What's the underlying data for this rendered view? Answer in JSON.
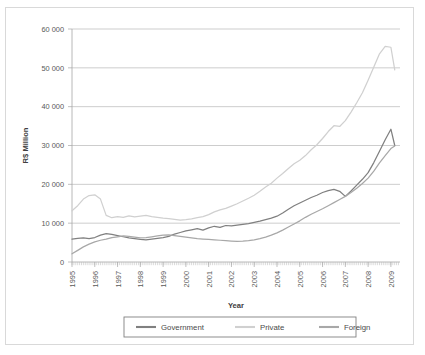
{
  "chart_data": {
    "type": "line",
    "title": "",
    "xlabel": "Year",
    "ylabel": "R$ Million",
    "xlim": [
      1995,
      2009.4
    ],
    "ylim": [
      0,
      60000
    ],
    "yticks": [
      0,
      10000,
      20000,
      30000,
      40000,
      50000,
      60000
    ],
    "ytick_labels": [
      "0",
      "10 000",
      "20 000",
      "30 000",
      "40 000",
      "50 000",
      "60 000"
    ],
    "xticks": [
      1995,
      1996,
      1997,
      1998,
      1999,
      2000,
      2001,
      2002,
      2003,
      2004,
      2005,
      2006,
      2007,
      2008,
      2009
    ],
    "xtick_labels": [
      "1995",
      "1996",
      "1997",
      "1998",
      "1999",
      "2000",
      "2001",
      "2002",
      "2003",
      "2004",
      "2005",
      "2006",
      "2007",
      "2008",
      "2009"
    ],
    "grid": "horizontal",
    "legend_position": "bottom",
    "legend": [
      "Government",
      "Private",
      "Foreign"
    ],
    "colors": {
      "government": "#808080",
      "private": "#d0d0d0",
      "foreign": "#a8a8a8"
    },
    "x": [
      1995.0,
      1995.25,
      1995.5,
      1995.75,
      1996.0,
      1996.25,
      1996.5,
      1996.75,
      1997.0,
      1997.25,
      1997.5,
      1997.75,
      1998.0,
      1998.25,
      1998.5,
      1998.75,
      1999.0,
      1999.25,
      1999.5,
      1999.75,
      2000.0,
      2000.25,
      2000.5,
      2000.75,
      2001.0,
      2001.25,
      2001.5,
      2001.75,
      2002.0,
      2002.25,
      2002.5,
      2002.75,
      2003.0,
      2003.25,
      2003.5,
      2003.75,
      2004.0,
      2004.25,
      2004.5,
      2004.75,
      2005.0,
      2005.25,
      2005.5,
      2005.75,
      2006.0,
      2006.25,
      2006.5,
      2006.75,
      2007.0,
      2007.25,
      2007.5,
      2007.75,
      2008.0,
      2008.25,
      2008.5,
      2008.75,
      2009.0,
      2009.17
    ],
    "series": [
      {
        "name": "Government",
        "color": "#808080",
        "values": [
          5900,
          6100,
          6200,
          6050,
          6300,
          6900,
          7300,
          7100,
          6800,
          6500,
          6200,
          6000,
          5800,
          5700,
          5900,
          6100,
          6300,
          6600,
          7200,
          7600,
          8000,
          8300,
          8600,
          8200,
          8800,
          9200,
          8900,
          9400,
          9300,
          9500,
          9700,
          9900,
          10200,
          10500,
          10900,
          11300,
          11800,
          12600,
          13600,
          14500,
          15200,
          15900,
          16600,
          17200,
          17900,
          18400,
          18700,
          18200,
          16900,
          18300,
          19800,
          21300,
          23000,
          25600,
          28500,
          31500,
          34200,
          30000
        ]
      },
      {
        "name": "Private",
        "color": "#d0d0d0",
        "values": [
          13200,
          14500,
          16200,
          17100,
          17300,
          16200,
          12000,
          11400,
          11700,
          11500,
          11900,
          11600,
          11800,
          12000,
          11700,
          11500,
          11300,
          11200,
          11000,
          10800,
          10900,
          11100,
          11400,
          11700,
          12200,
          12900,
          13400,
          13800,
          14400,
          15000,
          15700,
          16400,
          17200,
          18200,
          19300,
          20300,
          21600,
          22800,
          24100,
          25300,
          26200,
          27400,
          28900,
          30200,
          31800,
          33600,
          35100,
          34900,
          36400,
          38600,
          41000,
          43600,
          46800,
          50200,
          53600,
          55500,
          55300,
          49500
        ]
      },
      {
        "name": "Foreign",
        "color": "#a8a8a8",
        "values": [
          2100,
          3000,
          3900,
          4600,
          5200,
          5600,
          5900,
          6300,
          6500,
          6700,
          6600,
          6400,
          6200,
          6300,
          6500,
          6700,
          6900,
          7000,
          6800,
          6600,
          6400,
          6200,
          6000,
          5900,
          5800,
          5700,
          5600,
          5500,
          5400,
          5300,
          5350,
          5500,
          5700,
          6000,
          6400,
          6900,
          7500,
          8200,
          9000,
          9800,
          10600,
          11500,
          12300,
          13000,
          13700,
          14500,
          15300,
          16100,
          16900,
          17900,
          19000,
          20200,
          21600,
          23400,
          25500,
          27400,
          29200,
          29900
        ]
      }
    ]
  },
  "axes": {
    "ylabel_text": "R$ Million",
    "xlabel_text": "Year"
  },
  "legend": {
    "items": [
      {
        "label": "Government",
        "color": "#808080"
      },
      {
        "label": "Private",
        "color": "#d0d0d0"
      },
      {
        "label": "Foreign",
        "color": "#a8a8a8"
      }
    ]
  }
}
